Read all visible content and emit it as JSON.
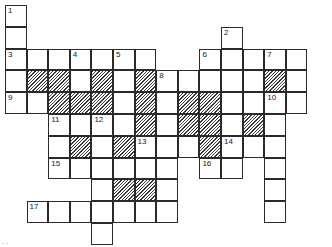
{
  "puzzle": {
    "type": "crossword",
    "rows": 11,
    "cols": 15,
    "cell_width": 21.6,
    "cell_height": 21.8,
    "origin_x": 5,
    "origin_y": 5,
    "colors": {
      "border": "#2a2a2a",
      "hatch": "#3a3a3a",
      "background": "#ffffff"
    },
    "cells": [
      {
        "r": 0,
        "c": 0,
        "n": "1"
      },
      {
        "r": 1,
        "c": 0
      },
      {
        "r": 1,
        "c": 10,
        "n": "2"
      },
      {
        "r": 2,
        "c": 0,
        "n": "3"
      },
      {
        "r": 2,
        "c": 1
      },
      {
        "r": 2,
        "c": 2
      },
      {
        "r": 2,
        "c": 3,
        "n": "4"
      },
      {
        "r": 2,
        "c": 4
      },
      {
        "r": 2,
        "c": 5,
        "n": "5"
      },
      {
        "r": 2,
        "c": 6
      },
      {
        "r": 2,
        "c": 9,
        "n": "6"
      },
      {
        "r": 2,
        "c": 10
      },
      {
        "r": 2,
        "c": 11
      },
      {
        "r": 2,
        "c": 12,
        "n": "7"
      },
      {
        "r": 2,
        "c": 13
      },
      {
        "r": 3,
        "c": 0
      },
      {
        "r": 3,
        "c": 1,
        "s": true
      },
      {
        "r": 3,
        "c": 2,
        "s": true
      },
      {
        "r": 3,
        "c": 3
      },
      {
        "r": 3,
        "c": 4,
        "s": true
      },
      {
        "r": 3,
        "c": 5
      },
      {
        "r": 3,
        "c": 6,
        "s": true
      },
      {
        "r": 3,
        "c": 7,
        "n": "8"
      },
      {
        "r": 3,
        "c": 8
      },
      {
        "r": 3,
        "c": 9
      },
      {
        "r": 3,
        "c": 10
      },
      {
        "r": 3,
        "c": 11
      },
      {
        "r": 3,
        "c": 12,
        "s": true
      },
      {
        "r": 3,
        "c": 13
      },
      {
        "r": 4,
        "c": 0,
        "n": "9"
      },
      {
        "r": 4,
        "c": 1
      },
      {
        "r": 4,
        "c": 2,
        "s": true
      },
      {
        "r": 4,
        "c": 3,
        "s": true
      },
      {
        "r": 4,
        "c": 4,
        "s": true
      },
      {
        "r": 4,
        "c": 5
      },
      {
        "r": 4,
        "c": 6,
        "s": true
      },
      {
        "r": 4,
        "c": 7
      },
      {
        "r": 4,
        "c": 8,
        "s": true
      },
      {
        "r": 4,
        "c": 9,
        "s": true
      },
      {
        "r": 4,
        "c": 10
      },
      {
        "r": 4,
        "c": 11
      },
      {
        "r": 4,
        "c": 12,
        "n": "10"
      },
      {
        "r": 4,
        "c": 13
      },
      {
        "r": 5,
        "c": 2,
        "n": "11"
      },
      {
        "r": 5,
        "c": 3
      },
      {
        "r": 5,
        "c": 4,
        "n": "12"
      },
      {
        "r": 5,
        "c": 5
      },
      {
        "r": 5,
        "c": 6,
        "s": true
      },
      {
        "r": 5,
        "c": 7
      },
      {
        "r": 5,
        "c": 8,
        "s": true
      },
      {
        "r": 5,
        "c": 9,
        "s": true
      },
      {
        "r": 5,
        "c": 10
      },
      {
        "r": 5,
        "c": 11,
        "s": true
      },
      {
        "r": 5,
        "c": 12
      },
      {
        "r": 6,
        "c": 2
      },
      {
        "r": 6,
        "c": 3,
        "s": true
      },
      {
        "r": 6,
        "c": 4
      },
      {
        "r": 6,
        "c": 5,
        "s": true
      },
      {
        "r": 6,
        "c": 6,
        "n": "13"
      },
      {
        "r": 6,
        "c": 7
      },
      {
        "r": 6,
        "c": 8
      },
      {
        "r": 6,
        "c": 9,
        "s": true
      },
      {
        "r": 6,
        "c": 10,
        "n": "14"
      },
      {
        "r": 6,
        "c": 11
      },
      {
        "r": 6,
        "c": 12
      },
      {
        "r": 7,
        "c": 2,
        "n": "15"
      },
      {
        "r": 7,
        "c": 3
      },
      {
        "r": 7,
        "c": 4
      },
      {
        "r": 7,
        "c": 5
      },
      {
        "r": 7,
        "c": 6
      },
      {
        "r": 7,
        "c": 7
      },
      {
        "r": 7,
        "c": 9,
        "n": "16"
      },
      {
        "r": 7,
        "c": 10
      },
      {
        "r": 7,
        "c": 12
      },
      {
        "r": 8,
        "c": 4
      },
      {
        "r": 8,
        "c": 5,
        "s": true
      },
      {
        "r": 8,
        "c": 6,
        "s": true
      },
      {
        "r": 8,
        "c": 7
      },
      {
        "r": 8,
        "c": 12
      },
      {
        "r": 9,
        "c": 1,
        "n": "17"
      },
      {
        "r": 9,
        "c": 2
      },
      {
        "r": 9,
        "c": 3
      },
      {
        "r": 9,
        "c": 4
      },
      {
        "r": 9,
        "c": 5
      },
      {
        "r": 9,
        "c": 6
      },
      {
        "r": 9,
        "c": 7
      },
      {
        "r": 9,
        "c": 12
      },
      {
        "r": 10,
        "c": 4
      }
    ]
  },
  "footer": {
    "marks": ". ."
  }
}
